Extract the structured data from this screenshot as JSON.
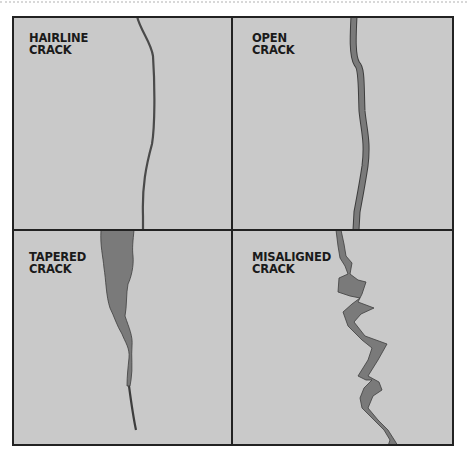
{
  "panels": [
    {
      "line1": "HAIRLINE",
      "line2": "CRACK"
    },
    {
      "line1": "OPEN",
      "line2": "CRACK"
    },
    {
      "line1": "TAPERED",
      "line2": "CRACK"
    },
    {
      "line1": "MISALIGNED",
      "line2": "CRACK"
    }
  ],
  "colors": {
    "panel_bg": "#c9c9c9",
    "border": "#222222",
    "crack_fill": "#7a7a7a",
    "crack_stroke": "#3d3d3d"
  }
}
